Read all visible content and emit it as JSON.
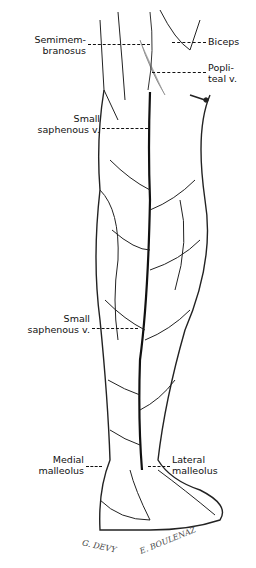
{
  "figure": {
    "labels": {
      "semimembranosus": [
        "Semimem-",
        "branosus"
      ],
      "biceps": [
        "Biceps"
      ],
      "popliteal": [
        "Popli-",
        "teal v."
      ],
      "small_saphenous_upper": [
        "Small",
        "saphenous v."
      ],
      "small_saphenous_lower": [
        "Small",
        "saphenous v."
      ],
      "medial_malleolus": [
        "Medial",
        "malleolus"
      ],
      "lateral_malleolus": [
        "Lateral",
        "malleolus"
      ]
    },
    "signatures": {
      "left": "G. DEVY",
      "right": "E. BOULENAZ"
    }
  }
}
